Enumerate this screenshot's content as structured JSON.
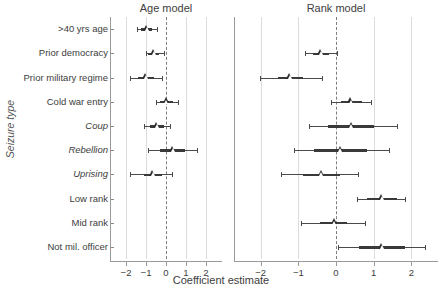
{
  "chart_data": {
    "type": "scatter",
    "plot_style": "coefficient-plot-with-confidence-intervals",
    "title": "",
    "xlabel": "Coefficient estimate",
    "ylabel": "Seizure type",
    "xlim": [
      -2.6,
      2.6
    ],
    "xticks": [
      -2,
      -1,
      0,
      1,
      2
    ],
    "xtick_labels": [
      "−2",
      "−1",
      "0",
      "1",
      "2"
    ],
    "grid": "vertical-gridlines-at-xticks",
    "reference_line": {
      "x": 0,
      "style": "dashed"
    },
    "legend": "none",
    "marker": "open-triangle",
    "categories": [
      {
        "label": ">40 yrs age",
        "italic": false
      },
      {
        "label": "Prior democracy",
        "italic": false
      },
      {
        "label": "Prior military regime",
        "italic": false
      },
      {
        "label": "Cold war entry",
        "italic": false
      },
      {
        "label": "Coup",
        "italic": true
      },
      {
        "label": "Rebellion",
        "italic": true
      },
      {
        "label": "Uprising",
        "italic": true
      },
      {
        "label": "Low rank",
        "italic": false
      },
      {
        "label": "Mid rank",
        "italic": false
      },
      {
        "label": "Not mil. officer",
        "italic": false
      }
    ],
    "panels": [
      {
        "name": "age-model",
        "title": "Age model",
        "points": [
          {
            "category": ">40 yrs age",
            "estimate": -0.95,
            "inner_low": -1.25,
            "inner_high": -0.68,
            "outer_low": -1.45,
            "outer_high": -0.45
          },
          {
            "category": "Prior democracy",
            "estimate": -0.6,
            "inner_low": -0.88,
            "inner_high": -0.34,
            "outer_low": -1.02,
            "outer_high": -0.12
          },
          {
            "category": "Prior military regime",
            "estimate": -1.0,
            "inner_low": -1.42,
            "inner_high": -0.58,
            "outer_low": -1.8,
            "outer_high": -0.18
          },
          {
            "category": "Cold war entry",
            "estimate": 0.03,
            "inner_low": -0.28,
            "inner_high": 0.34,
            "outer_low": -0.48,
            "outer_high": 0.58
          },
          {
            "category": "Coup",
            "estimate": -0.45,
            "inner_low": -0.78,
            "inner_high": -0.12,
            "outer_low": -1.12,
            "outer_high": 0.18
          },
          {
            "category": "Rebellion",
            "estimate": 0.35,
            "inner_low": -0.3,
            "inner_high": 0.95,
            "outer_low": -0.88,
            "outer_high": 1.56
          },
          {
            "category": "Uprising",
            "estimate": -0.65,
            "inner_low": -1.1,
            "inner_high": -0.18,
            "outer_low": -1.82,
            "outer_high": 0.32
          },
          {
            "category": "Low rank",
            "estimate": null,
            "inner_low": null,
            "inner_high": null,
            "outer_low": null,
            "outer_high": null
          },
          {
            "category": "Mid rank",
            "estimate": null,
            "inner_low": null,
            "inner_high": null,
            "outer_low": null,
            "outer_high": null
          },
          {
            "category": "Not mil. officer",
            "estimate": null,
            "inner_low": null,
            "inner_high": null,
            "outer_low": null,
            "outer_high": null
          }
        ]
      },
      {
        "name": "rank-model",
        "title": "Rank model",
        "points": [
          {
            "category": ">40 yrs age",
            "estimate": null,
            "inner_low": null,
            "inner_high": null,
            "outer_low": null,
            "outer_high": null
          },
          {
            "category": "Prior democracy",
            "estimate": -0.4,
            "inner_low": -0.62,
            "inner_high": -0.18,
            "outer_low": -0.82,
            "outer_high": 0.02
          },
          {
            "category": "Prior military regime",
            "estimate": -1.22,
            "inner_low": -1.55,
            "inner_high": -0.88,
            "outer_low": -2.02,
            "outer_high": -0.38
          },
          {
            "category": "Cold war entry",
            "estimate": 0.4,
            "inner_low": 0.12,
            "inner_high": 0.7,
            "outer_low": -0.12,
            "outer_high": 0.92
          },
          {
            "category": "Coup",
            "estimate": 0.42,
            "inner_low": -0.22,
            "inner_high": 1.02,
            "outer_low": -0.72,
            "outer_high": 1.62
          },
          {
            "category": "Rebellion",
            "estimate": 0.12,
            "inner_low": -0.58,
            "inner_high": 0.82,
            "outer_low": -1.12,
            "outer_high": 1.4
          },
          {
            "category": "Uprising",
            "estimate": -0.38,
            "inner_low": -0.88,
            "inner_high": 0.1,
            "outer_low": -1.45,
            "outer_high": 0.58
          },
          {
            "category": "Low rank",
            "estimate": 1.22,
            "inner_low": 0.82,
            "inner_high": 1.62,
            "outer_low": 0.55,
            "outer_high": 1.82
          },
          {
            "category": "Mid rank",
            "estimate": -0.05,
            "inner_low": -0.42,
            "inner_high": 0.3,
            "outer_low": -0.92,
            "outer_high": 0.78
          },
          {
            "category": "Not mil. officer",
            "estimate": 1.22,
            "inner_low": 0.62,
            "inner_high": 1.82,
            "outer_low": 0.05,
            "outer_high": 2.35
          }
        ]
      }
    ]
  },
  "axis": {
    "xlabel": "Coefficient estimate",
    "ylabel": "Seizure type"
  }
}
